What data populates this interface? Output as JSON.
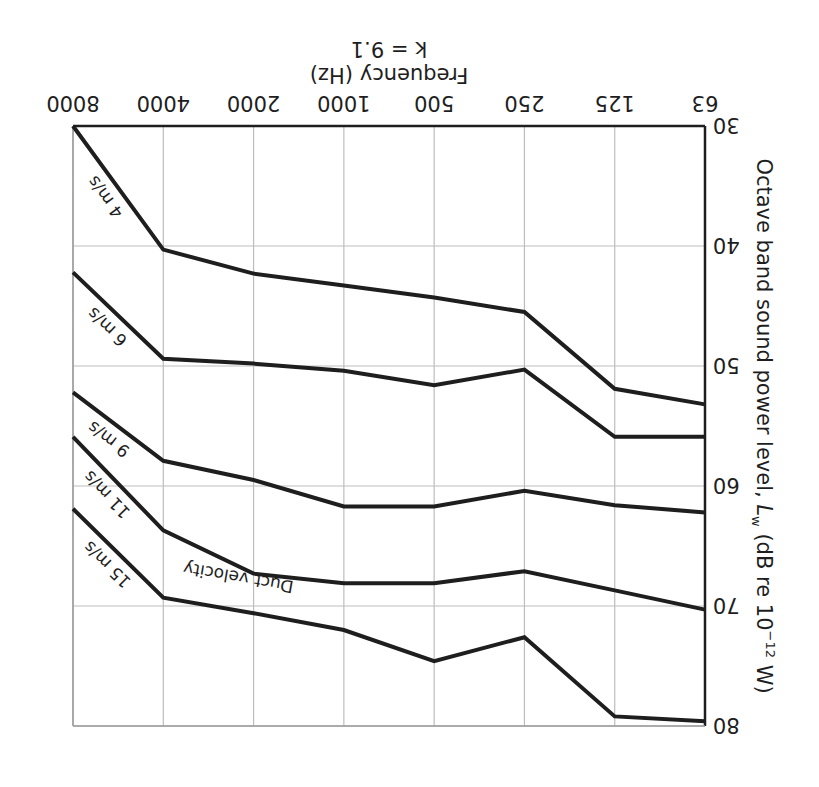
{
  "chart_data": {
    "type": "line",
    "title": "",
    "xlabel": "Frequency (Hz)",
    "xlabel_note": "k = 9.1",
    "ylabel": "Octave band sound power level, Lw (dB re 10^-12 W)",
    "ylabel_parts": {
      "main": "Octave band sound power level, ",
      "symbol": "L",
      "sub": "w",
      "unit_pre": " (dB re 10",
      "sup": "−12",
      "unit_post": " W)"
    },
    "categories": [
      "63",
      "125",
      "250",
      "500",
      "1000",
      "2000",
      "4000",
      "8000"
    ],
    "y_ticks": [
      "30",
      "40",
      "50",
      "60",
      "70",
      "80"
    ],
    "ylim": [
      30,
      80
    ],
    "y_inverted": true,
    "grid": true,
    "legend_title": "Duct velocity",
    "series": [
      {
        "name": "4 m/s",
        "values": [
          53.2,
          51.9,
          45.5,
          44.3,
          43.3,
          42.3,
          40.3,
          30.0
        ]
      },
      {
        "name": "6 m/s",
        "values": [
          55.9,
          55.9,
          50.3,
          51.6,
          50.4,
          49.8,
          49.4,
          42.2
        ]
      },
      {
        "name": "9 m/s",
        "values": [
          62.2,
          61.6,
          60.4,
          61.7,
          61.7,
          59.5,
          57.9,
          52.2
        ]
      },
      {
        "name": "11 m/s",
        "values": [
          70.3,
          68.7,
          67.1,
          68.1,
          68.1,
          67.3,
          63.7,
          55.9
        ]
      },
      {
        "name": "15 m/s",
        "values": [
          79.6,
          79.2,
          72.6,
          74.6,
          72.0,
          70.6,
          69.3,
          61.9
        ]
      }
    ]
  }
}
